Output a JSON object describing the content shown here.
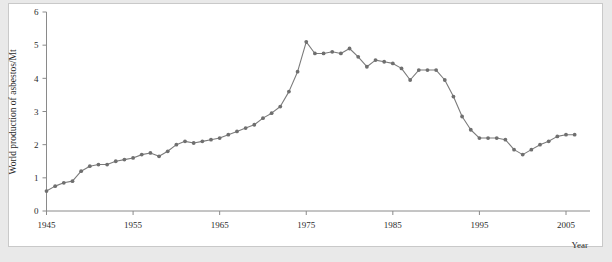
{
  "panel": {
    "background": "#ffffff",
    "border_color": "#c9c9c9",
    "page_background": "#e9e9e9"
  },
  "labels": {
    "y_axis_title": "World production of asbestos/Mt",
    "x_axis_title": "Year"
  },
  "chart_data": {
    "type": "line",
    "title": "",
    "xlabel": "Year",
    "ylabel": "World production of asbestos/Mt",
    "xlim": [
      1944,
      2007
    ],
    "ylim": [
      0,
      6
    ],
    "xticks": [
      1945,
      1955,
      1965,
      1975,
      1985,
      1995,
      2005
    ],
    "xtick_labels": [
      "1945",
      "1955",
      "1965",
      "1975",
      "1985",
      "1995",
      "2005"
    ],
    "yticks": [
      0,
      1,
      2,
      3,
      4,
      5,
      6
    ],
    "ytick_labels": [
      "0",
      "1",
      "2",
      "3",
      "4",
      "5",
      "6"
    ],
    "grid": false,
    "legend": false,
    "marker": "dot",
    "line_color": "#7b7b7b",
    "marker_color": "#6f6f6f",
    "series": [
      {
        "name": "World production of asbestos",
        "x": [
          1945,
          1946,
          1947,
          1948,
          1949,
          1950,
          1951,
          1952,
          1953,
          1954,
          1955,
          1956,
          1957,
          1958,
          1959,
          1960,
          1961,
          1962,
          1963,
          1964,
          1965,
          1966,
          1967,
          1968,
          1969,
          1970,
          1971,
          1972,
          1973,
          1974,
          1975,
          1976,
          1977,
          1978,
          1979,
          1980,
          1981,
          1982,
          1983,
          1984,
          1985,
          1986,
          1987,
          1988,
          1989,
          1990,
          1991,
          1992,
          1993,
          1994,
          1995,
          1996,
          1997,
          1998,
          1999,
          2000,
          2001,
          2002,
          2003,
          2004,
          2005,
          2006
        ],
        "values": [
          0.6,
          0.75,
          0.85,
          0.9,
          1.2,
          1.35,
          1.4,
          1.4,
          1.5,
          1.55,
          1.6,
          1.7,
          1.75,
          1.65,
          1.8,
          2.0,
          2.1,
          2.05,
          2.1,
          2.15,
          2.2,
          2.3,
          2.4,
          2.5,
          2.6,
          2.8,
          2.95,
          3.15,
          3.6,
          4.2,
          5.1,
          4.75,
          4.75,
          4.8,
          4.75,
          4.9,
          4.65,
          4.35,
          4.55,
          4.5,
          4.45,
          4.3,
          3.95,
          4.25,
          4.25,
          4.25,
          3.95,
          3.45,
          2.85,
          2.45,
          2.2,
          2.2,
          2.2,
          2.15,
          1.85,
          1.7,
          1.85,
          2.0,
          2.1,
          2.25,
          2.3,
          2.3
        ]
      }
    ]
  }
}
